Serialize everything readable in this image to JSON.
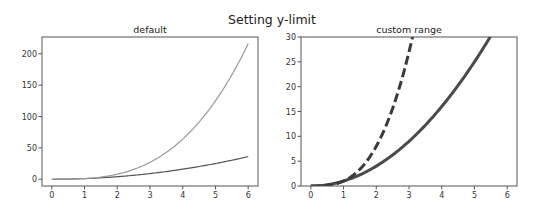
{
  "chart_data": {
    "type": "line",
    "suptitle": "Setting y-limit",
    "panels": [
      {
        "title": "default",
        "xlabel": "",
        "ylabel": "",
        "xlim": [
          -0.3,
          6.3
        ],
        "ylim": [
          -10.8,
          226.8
        ],
        "xticks": [
          0,
          1,
          2,
          3,
          4,
          5,
          6
        ],
        "yticks": [
          0,
          50,
          100,
          150,
          200
        ],
        "grid": false,
        "series": [
          {
            "name": "x^2",
            "function": "x^2",
            "x": [
              0,
              0.5,
              1,
              1.5,
              2,
              2.5,
              3,
              3.5,
              4,
              4.5,
              5,
              5.5,
              6
            ],
            "y": [
              0,
              0.25,
              1,
              2.25,
              4,
              6.25,
              9,
              12.25,
              16,
              20.25,
              25,
              30.25,
              36
            ],
            "color": "#555555",
            "style": "solid",
            "width": 1.2
          },
          {
            "name": "x^3",
            "function": "x^3",
            "x": [
              0,
              0.5,
              1,
              1.5,
              2,
              2.5,
              3,
              3.5,
              4,
              4.5,
              5,
              5.5,
              6
            ],
            "y": [
              0,
              0.125,
              1,
              3.375,
              8,
              15.625,
              27,
              42.875,
              64,
              91.125,
              125,
              166.375,
              216
            ],
            "color": "#9a9a9a",
            "style": "solid",
            "width": 1.2
          }
        ]
      },
      {
        "title": "custom range",
        "xlabel": "",
        "ylabel": "",
        "xlim": [
          -0.3,
          6.3
        ],
        "ylim": [
          0,
          30
        ],
        "xticks": [
          0,
          1,
          2,
          3,
          4,
          5,
          6
        ],
        "yticks": [
          0,
          5,
          10,
          15,
          20,
          25,
          30
        ],
        "grid": false,
        "series": [
          {
            "name": "x^2",
            "function": "x^2",
            "x": [
              0,
              0.5,
              1,
              1.5,
              2,
              2.5,
              3,
              3.5,
              4,
              4.5,
              5,
              5.5,
              6
            ],
            "y": [
              0,
              0.25,
              1,
              2.25,
              4,
              6.25,
              9,
              12.25,
              16,
              20.25,
              25,
              30.25,
              36
            ],
            "color": "#4a4a4a",
            "style": "solid",
            "width": 3
          },
          {
            "name": "x^3",
            "function": "x^3",
            "x": [
              0,
              0.5,
              1,
              1.5,
              2,
              2.5,
              3,
              3.5,
              4,
              4.5,
              5,
              5.5,
              6
            ],
            "y": [
              0,
              0.125,
              1,
              3.375,
              8,
              15.625,
              27,
              42.875,
              64,
              91.125,
              125,
              166.375,
              216
            ],
            "color": "#3a3a3a",
            "style": "dashed",
            "width": 3
          }
        ]
      }
    ]
  }
}
